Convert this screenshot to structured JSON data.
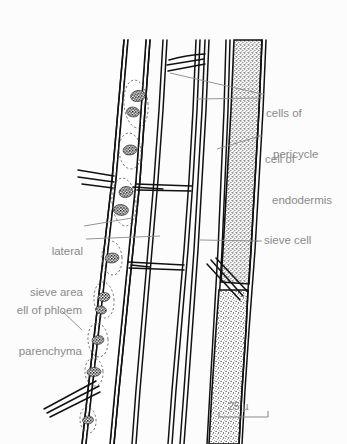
{
  "figure": {
    "type": "botanical-micrograph-drawing",
    "background_color": "#fcfcfc",
    "ink_color": "#111111",
    "label_color": "#8a8a8a"
  },
  "labels": {
    "cells_of_pericycle": {
      "text": "cells of\npericycle",
      "line1": "cells of",
      "line2": "pericycle",
      "side": "right"
    },
    "cell_of_endodermis": {
      "text": "cell of\nendodermis",
      "line1": "cell of",
      "line2": "endodermis",
      "side": "right"
    },
    "sieve_cell": {
      "text": "sieve cell",
      "side": "right"
    },
    "lateral_sieve_area": {
      "text": "lateral\nsieve area",
      "line1": "lateral",
      "line2": "sieve area",
      "side": "left"
    },
    "cell_of_phloem_parenchyma": {
      "text": "ell of phloem\nparenchyma",
      "line1": "ell of phloem",
      "line2": "parenchyma",
      "side": "left"
    }
  },
  "scale_bar": {
    "value": "25",
    "unit": "µ",
    "text": "25 µ"
  }
}
